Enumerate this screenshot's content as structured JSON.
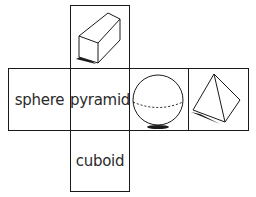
{
  "colors": {
    "line": "#1a1a1a",
    "text": "#2a2a2a",
    "background": "#ffffff"
  },
  "net": {
    "top": {
      "type": "image",
      "shape": "cuboid-icon"
    },
    "middle": [
      {
        "type": "label",
        "text": "sphere"
      },
      {
        "type": "label",
        "text": "pyramid"
      },
      {
        "type": "image",
        "shape": "sphere-icon"
      },
      {
        "type": "image",
        "shape": "pyramid-icon"
      }
    ],
    "bottom": {
      "type": "label",
      "text": "cuboid"
    }
  }
}
